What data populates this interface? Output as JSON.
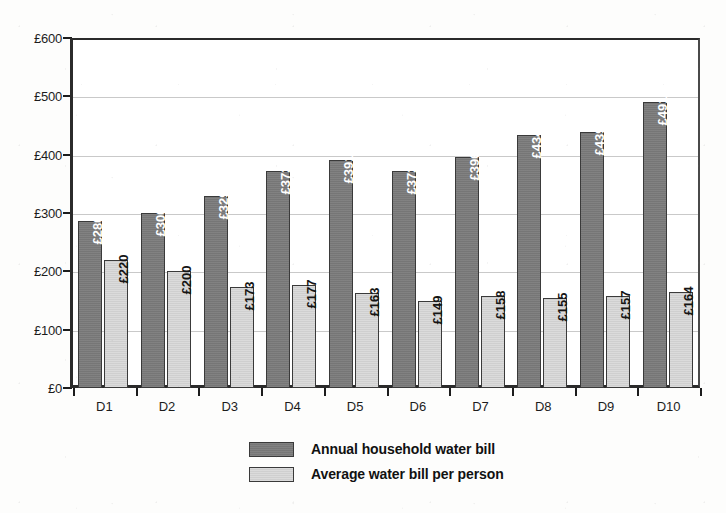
{
  "chart_data": {
    "type": "bar",
    "title": "",
    "subtitle": "",
    "xlabel": "",
    "ylabel": "",
    "categories": [
      "D1",
      "D2",
      "D3",
      "D4",
      "D5",
      "D6",
      "D7",
      "D8",
      "D9",
      "D10"
    ],
    "series": [
      {
        "name": "Annual household water bill",
        "color": "#7b7b7b",
        "values": [
          286,
          300,
          329,
          372,
          391,
          372,
          396,
          434,
          439,
          491
        ],
        "labels": [
          "£286",
          "£300",
          "£329",
          "£372",
          "£391",
          "£372",
          "£396",
          "£434",
          "£439",
          "£491"
        ]
      },
      {
        "name": "Average water bill per person",
        "color": "#d6d6d6",
        "values": [
          220,
          200,
          173,
          177,
          163,
          149,
          158,
          155,
          157,
          164
        ],
        "labels": [
          "£220",
          "£200",
          "£173",
          "£177",
          "£163",
          "£149",
          "£158",
          "£155",
          "£157",
          "£164"
        ]
      }
    ],
    "ylim": [
      0,
      600
    ],
    "y_ticks": [
      0,
      100,
      200,
      300,
      400,
      500,
      600
    ],
    "y_tick_labels": [
      "£0",
      "£100",
      "£200",
      "£300",
      "£400",
      "£500",
      "£600"
    ],
    "grid": true,
    "grid_axis": "y",
    "legend_position": "bottom"
  },
  "legend": {
    "entries": [
      {
        "label": "Annual household water bill"
      },
      {
        "label": "Average water bill per person"
      }
    ]
  }
}
